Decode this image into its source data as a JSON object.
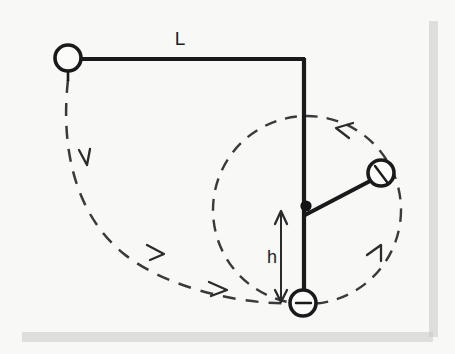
{
  "figure": {
    "background_color": "#f7f7f5",
    "ink_color": "#1a1a1a",
    "dash_color": "#3a3a3a",
    "shadow_color": "#c9c9c9",
    "labels": {
      "length_label": "L",
      "height_label": "h"
    },
    "elements": {
      "support_pivot_label": "support-pivot-ball",
      "corner_label": "rod-corner",
      "peg_label": "peg-dot",
      "swing_bob_label": "swing-bob",
      "bottom_bob_label": "bottom-bob"
    },
    "geometry": {
      "left_ball": {
        "cx": 68,
        "cy": 58,
        "r": 13
      },
      "left_ball_stub": {
        "x1": 68,
        "y1": 71,
        "x2": 68,
        "y2": 80
      },
      "horizontal_rod": {
        "x1": 81,
        "y1": 59,
        "x2": 304,
        "y2": 59
      },
      "vertical_rod": {
        "x1": 304,
        "y1": 59,
        "x2": 304,
        "y2": 292
      },
      "peg_dot": {
        "cx": 306,
        "cy": 206,
        "r": 5.4
      },
      "short_rod": {
        "x1": 305,
        "y1": 215,
        "x2": 371,
        "y2": 180
      },
      "right_ball": {
        "cx": 381,
        "cy": 173,
        "r": 13
      },
      "right_ball_tick": {
        "x1": 375,
        "y1": 166,
        "x2": 386,
        "y2": 181
      },
      "bottom_ball": {
        "cx": 303,
        "cy": 303,
        "r": 13
      },
      "bottom_ball_tick": {
        "x1": 296,
        "y1": 303,
        "x2": 311,
        "y2": 303
      },
      "large_arc": "M 68,80 C 62,150 98,240 172,273 C 228,298 272,304 291,303",
      "small_circle": {
        "cx": 307,
        "cy": 209,
        "r": 94
      },
      "dimension_arrow": {
        "x": 281,
        "y_top": 212,
        "y_bottom": 300
      },
      "L_label_pos": {
        "x": 180,
        "y": 44
      },
      "h_label_pos": {
        "x": 271,
        "y": 262
      }
    },
    "arrows": [
      {
        "name": "large-arc-arrow-1",
        "x": 86,
        "y": 160,
        "angle": 62
      },
      {
        "name": "large-arc-arrow-2",
        "x": 160,
        "y": 254,
        "angle": 32
      },
      {
        "name": "large-arc-arrow-3",
        "x": 223,
        "y": 289,
        "angle": 14
      },
      {
        "name": "small-circle-arrow-top",
        "x": 341,
        "y": 128,
        "angle": 215
      },
      {
        "name": "small-circle-arrow-right",
        "x": 379,
        "y": 251,
        "angle": 300
      }
    ],
    "shadow": {
      "right_strip": {
        "x": 429,
        "y": 21,
        "w": 9,
        "h": 316
      },
      "bottom_strip": {
        "x": 22,
        "y": 332,
        "w": 411,
        "h": 10
      }
    }
  }
}
